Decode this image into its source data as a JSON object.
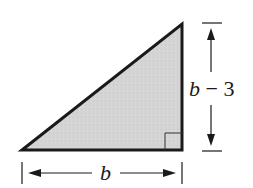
{
  "diagram": {
    "type": "right-triangle",
    "fill_color": "#d4d4d4",
    "stroke_color": "#1a1a1a",
    "vertices": [
      [
        22,
        150
      ],
      [
        182,
        24
      ],
      [
        182,
        150
      ]
    ],
    "right_angle_at": [
      182,
      150
    ],
    "labels": {
      "base": {
        "var": "b",
        "text": "b"
      },
      "height": {
        "var": "b",
        "op": " − ",
        "num": "3",
        "text": "b − 3"
      }
    }
  }
}
